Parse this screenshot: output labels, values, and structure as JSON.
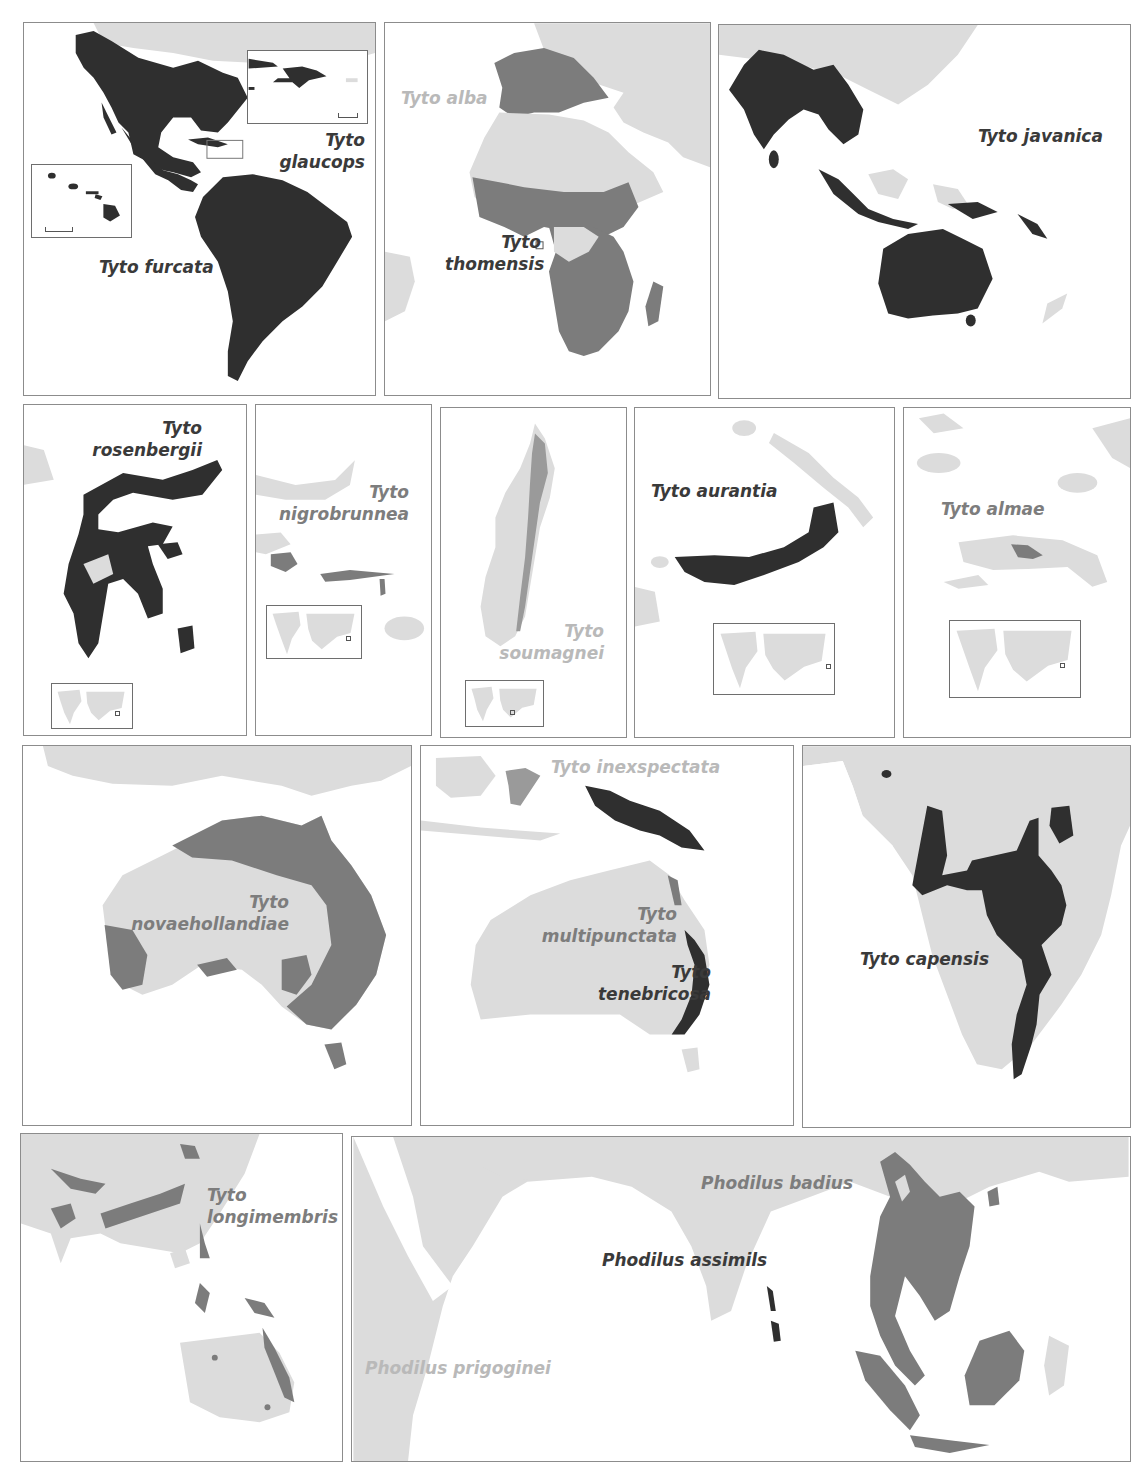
{
  "figure": {
    "type": "species-range-map-grid",
    "colors": {
      "land": "#dcdcdc",
      "range_dark": "#2f2f2f",
      "range_mid": "#7c7c7c",
      "range_light": "#b8b8b8",
      "panel_border": "#8c8c8c",
      "water": "#ffffff"
    }
  },
  "panels": [
    {
      "id": "americas",
      "labels": [
        {
          "text_line1": "Tyto",
          "text_line2": "glaucops",
          "tone": "dark"
        },
        {
          "text": "Tyto furcata",
          "tone": "dark"
        }
      ],
      "insets": [
        "hawaii-inset",
        "hispaniola-inset"
      ]
    },
    {
      "id": "africa-europe",
      "labels": [
        {
          "text": "Tyto alba",
          "tone": "light"
        },
        {
          "text_line1": "Tyto",
          "text_line2": "thomensis",
          "tone": "dark"
        }
      ]
    },
    {
      "id": "south-asia-australia",
      "labels": [
        {
          "text": "Tyto javanica",
          "tone": "dark"
        }
      ]
    },
    {
      "id": "sulawesi",
      "labels": [
        {
          "text_line1": "Tyto",
          "text_line2": "rosenbergii",
          "tone": "dark"
        }
      ],
      "insets": [
        "world-locator"
      ]
    },
    {
      "id": "sula-islands",
      "labels": [
        {
          "text_line1": "Tyto",
          "text_line2": "nigrobrunnea",
          "tone": "mid"
        }
      ],
      "insets": [
        "world-locator"
      ]
    },
    {
      "id": "madagascar",
      "labels": [
        {
          "text_line1": "Tyto",
          "text_line2": "soumagnei",
          "tone": "light"
        }
      ],
      "insets": [
        "world-locator"
      ]
    },
    {
      "id": "new-britain",
      "labels": [
        {
          "text": "Tyto aurantia",
          "tone": "dark"
        }
      ],
      "insets": [
        "world-locator"
      ]
    },
    {
      "id": "seram",
      "labels": [
        {
          "text": "Tyto almae",
          "tone": "mid"
        }
      ],
      "insets": [
        "world-locator"
      ]
    },
    {
      "id": "australia-1",
      "labels": [
        {
          "text_line1": "Tyto",
          "text_line2": "novaehollandiae",
          "tone": "mid"
        }
      ]
    },
    {
      "id": "australia-2",
      "labels": [
        {
          "text": "Tyto inexspectata",
          "tone": "light"
        },
        {
          "text_line1": "Tyto",
          "text_line2": "multipunctata",
          "tone": "mid"
        },
        {
          "text_line1": "Tyto",
          "text_line2": "tenebricosa",
          "tone": "dark"
        }
      ]
    },
    {
      "id": "southern-africa",
      "labels": [
        {
          "text": "Tyto capensis",
          "tone": "dark"
        }
      ]
    },
    {
      "id": "asia-australasia",
      "labels": [
        {
          "text_line1": "Tyto",
          "text_line2": "longimembris",
          "tone": "mid"
        }
      ]
    },
    {
      "id": "indian-ocean",
      "labels": [
        {
          "text": "Phodilus badius",
          "tone": "mid"
        },
        {
          "text": "Phodilus assimils",
          "tone": "dark"
        },
        {
          "text": "Phodilus prigoginei",
          "tone": "light"
        }
      ]
    }
  ]
}
